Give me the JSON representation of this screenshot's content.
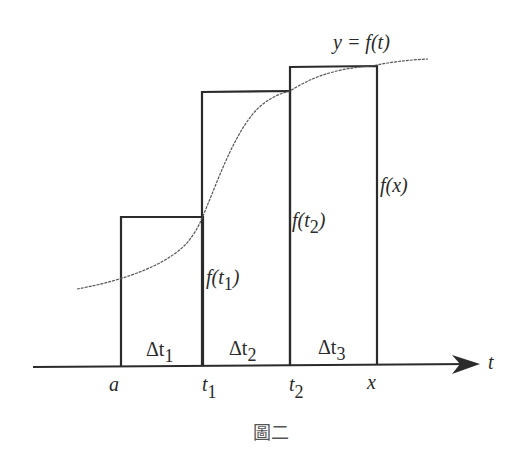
{
  "figure": {
    "caption": "圖二",
    "curve_label": "y = f(t)",
    "axis_label": "t",
    "tick_labels": {
      "a": "a",
      "t1": "t",
      "t1_sub": "1",
      "t2": "t",
      "t2_sub": "2",
      "x": "x"
    },
    "interval_labels": [
      {
        "delta": "Δt",
        "sub": "1"
      },
      {
        "delta": "Δt",
        "sub": "2"
      },
      {
        "delta": "Δt",
        "sub": "3"
      }
    ],
    "height_labels": [
      {
        "text": "f(t",
        "sub": "1",
        "close": ")"
      },
      {
        "text": "f(t",
        "sub": "2",
        "close": ")"
      },
      {
        "text": "f(x)"
      }
    ],
    "colors": {
      "line": "#2b2b2b",
      "curve": "#555555",
      "background": "#ffffff"
    }
  }
}
